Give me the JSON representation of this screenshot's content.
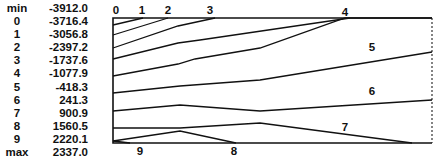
{
  "chart_data": {
    "type": "contour",
    "title": "",
    "legend": [
      {
        "key": "min",
        "value": "-3912.0"
      },
      {
        "key": "0",
        "value": "-3716.4"
      },
      {
        "key": "1",
        "value": "-3056.8"
      },
      {
        "key": "2",
        "value": "-2397.2"
      },
      {
        "key": "3",
        "value": "-1737.6"
      },
      {
        "key": "4",
        "value": "-1077.9"
      },
      {
        "key": "5",
        "value": "-418.3"
      },
      {
        "key": "6",
        "value": "241.3"
      },
      {
        "key": "7",
        "value": "900.9"
      },
      {
        "key": "8",
        "value": "1560.5"
      },
      {
        "key": "9",
        "value": "2220.1"
      },
      {
        "key": "max",
        "value": "2337.0"
      }
    ],
    "contour_levels": [
      -3716.4,
      -3056.8,
      -2397.2,
      -1737.6,
      -1077.9,
      -418.3,
      241.3,
      900.9,
      1560.5,
      2220.1
    ],
    "contour_labels": [
      {
        "label": "0",
        "x": 116,
        "y": 14
      },
      {
        "label": "1",
        "x": 142,
        "y": 14
      },
      {
        "label": "2",
        "x": 168,
        "y": 14
      },
      {
        "label": "3",
        "x": 210,
        "y": 14
      },
      {
        "label": "4",
        "x": 345,
        "y": 16
      },
      {
        "label": "5",
        "x": 372,
        "y": 51
      },
      {
        "label": "6",
        "x": 372,
        "y": 95
      },
      {
        "label": "7",
        "x": 345,
        "y": 131
      },
      {
        "label": "8",
        "x": 234,
        "y": 155
      },
      {
        "label": "9",
        "x": 140,
        "y": 155
      }
    ],
    "lines": [
      {
        "level": "0",
        "points": [
          [
            113,
            25
          ],
          [
            143,
            18
          ]
        ]
      },
      {
        "level": "1",
        "points": [
          [
            113,
            35
          ],
          [
            168,
            18
          ]
        ]
      },
      {
        "level": "2",
        "points": [
          [
            113,
            48
          ],
          [
            178,
            26
          ],
          [
            215,
            18
          ]
        ]
      },
      {
        "level": "3",
        "points": [
          [
            113,
            59
          ],
          [
            178,
            43
          ],
          [
            200,
            40
          ],
          [
            350,
            18
          ]
        ]
      },
      {
        "level": "4",
        "points": [
          [
            113,
            76
          ],
          [
            178,
            64
          ],
          [
            195,
            59
          ],
          [
            260,
            48
          ],
          [
            345,
            18
          ],
          [
            432,
            18
          ]
        ]
      },
      {
        "level": "5",
        "points": [
          [
            113,
            93
          ],
          [
            180,
            86
          ],
          [
            260,
            80
          ],
          [
            432,
            52
          ]
        ]
      },
      {
        "level": "6",
        "points": [
          [
            113,
            111
          ],
          [
            180,
            105
          ],
          [
            260,
            111
          ],
          [
            432,
            100
          ]
        ]
      },
      {
        "level": "7",
        "points": [
          [
            113,
            128
          ],
          [
            180,
            128
          ],
          [
            260,
            123
          ],
          [
            412,
            143
          ]
        ]
      },
      {
        "level": "8",
        "points": [
          [
            113,
            141
          ],
          [
            180,
            131
          ],
          [
            236,
            143
          ]
        ]
      },
      {
        "level": "9",
        "points": [
          [
            113,
            141
          ],
          [
            130,
            143
          ]
        ]
      }
    ],
    "frame": {
      "x0": 113,
      "y0": 18,
      "x1": 432,
      "y1": 143
    }
  }
}
